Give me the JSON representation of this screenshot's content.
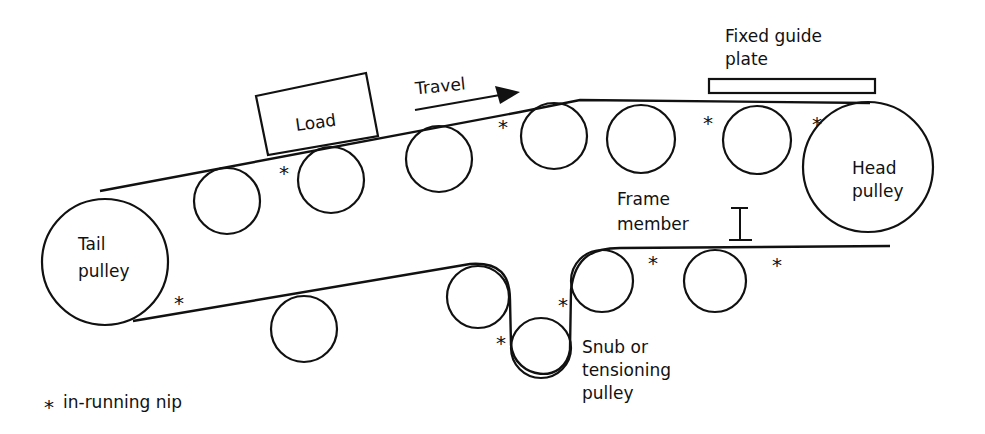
{
  "diagram": {
    "type": "belt-conveyor-schematic",
    "labels": {
      "load": "Load",
      "travel": "Travel",
      "guide_plate_line1": "Fixed guide",
      "guide_plate_line2": "plate",
      "head_line1": "Head",
      "head_line2": "pulley",
      "tail_line1": "Tail",
      "tail_line2": "pulley",
      "frame_line1": "Frame",
      "frame_line2": "member",
      "snub_line1": "Snub or",
      "snub_line2": "tensioning",
      "snub_line3": "pulley"
    },
    "legend": {
      "symbol": "*",
      "text": "in-running nip"
    },
    "nip_symbol": "*",
    "components": {
      "pulleys": [
        "Tail pulley",
        "Head pulley",
        "Snub or tensioning pulley"
      ],
      "upper_idlers": 6,
      "lower_return_idlers": 4,
      "fixed_guide_plate": 1,
      "frame_member": 1,
      "load": 1
    },
    "in_running_nip_count": 10
  }
}
